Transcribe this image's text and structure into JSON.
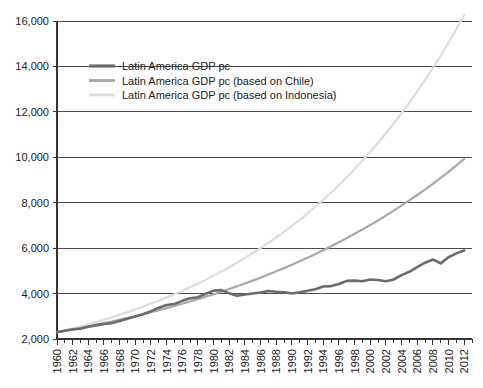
{
  "chart_data": {
    "type": "line",
    "title": "",
    "subtitle": "",
    "xlabel": "",
    "ylabel": "",
    "grid": true,
    "legend_position": "top-left-inside",
    "xlim": [
      1960,
      2013
    ],
    "ylim": [
      2000,
      16000
    ],
    "ytick_labels": [
      "16,000",
      "14,000",
      "12,000",
      "10,000",
      "8,000",
      "6,000",
      "4,000",
      "2,000"
    ],
    "ytick_values": [
      16000,
      14000,
      12000,
      10000,
      8000,
      6000,
      4000,
      2000
    ],
    "xtick_labels": [
      "1960",
      "1962",
      "1964",
      "1966",
      "1968",
      "1970",
      "1972",
      "1974",
      "1976",
      "1978",
      "1980",
      "1982",
      "1984",
      "1986",
      "1988",
      "1990",
      "1992",
      "1994",
      "1996",
      "1998",
      "2000",
      "2002",
      "2004",
      "2006",
      "2008",
      "2010",
      "2012"
    ],
    "xtick_values": [
      1960,
      1962,
      1964,
      1966,
      1968,
      1970,
      1972,
      1974,
      1976,
      1978,
      1980,
      1982,
      1984,
      1986,
      1988,
      1990,
      1992,
      1994,
      1996,
      1998,
      2000,
      2002,
      2004,
      2006,
      2008,
      2010,
      2012
    ],
    "x": [
      1960,
      1961,
      1962,
      1963,
      1964,
      1965,
      1966,
      1967,
      1968,
      1969,
      1970,
      1971,
      1972,
      1973,
      1974,
      1975,
      1976,
      1977,
      1978,
      1979,
      1980,
      1981,
      1982,
      1983,
      1984,
      1985,
      1986,
      1987,
      1988,
      1989,
      1990,
      1991,
      1992,
      1993,
      1994,
      1995,
      1996,
      1997,
      1998,
      1999,
      2000,
      2001,
      2002,
      2003,
      2004,
      2005,
      2006,
      2007,
      2008,
      2009,
      2010,
      2011,
      2012
    ],
    "series": [
      {
        "name": "Latin America GDP pc",
        "color": "#6b6b6b",
        "width": 2.6,
        "values": [
          2300,
          2360,
          2420,
          2450,
          2540,
          2600,
          2660,
          2700,
          2790,
          2890,
          2990,
          3090,
          3220,
          3380,
          3500,
          3540,
          3680,
          3790,
          3840,
          3990,
          4130,
          4150,
          4010,
          3900,
          3960,
          4000,
          4050,
          4110,
          4080,
          4060,
          4000,
          4060,
          4120,
          4190,
          4310,
          4330,
          4420,
          4560,
          4570,
          4540,
          4620,
          4600,
          4540,
          4620,
          4810,
          4960,
          5160,
          5360,
          5500,
          5330,
          5600,
          5770,
          5900
        ]
      },
      {
        "name": "Latin America GDP pc (based on Chile)",
        "color": "#a8a8a8",
        "width": 2.2,
        "values": [
          2300,
          2360,
          2430,
          2490,
          2560,
          2630,
          2700,
          2770,
          2850,
          2930,
          3010,
          3090,
          3180,
          3270,
          3360,
          3450,
          3550,
          3650,
          3750,
          3860,
          3970,
          4080,
          4200,
          4320,
          4440,
          4570,
          4700,
          4840,
          4980,
          5120,
          5270,
          5420,
          5580,
          5740,
          5910,
          6080,
          6260,
          6440,
          6630,
          6820,
          7020,
          7220,
          7430,
          7650,
          7870,
          8100,
          8340,
          8580,
          8830,
          9090,
          9360,
          9640,
          9930
        ]
      },
      {
        "name": "Latin America GDP pc (based on Indonesia)",
        "color": "#dcdcdc",
        "width": 2.2,
        "values": [
          2300,
          2380,
          2470,
          2560,
          2650,
          2750,
          2850,
          2960,
          3070,
          3180,
          3300,
          3430,
          3560,
          3690,
          3830,
          3970,
          4120,
          4280,
          4440,
          4610,
          4790,
          4970,
          5160,
          5360,
          5570,
          5780,
          6000,
          6230,
          6470,
          6720,
          6980,
          7250,
          7530,
          7830,
          8130,
          8450,
          8780,
          9120,
          9480,
          9850,
          10240,
          10640,
          11060,
          11490,
          11940,
          12410,
          12900,
          13400,
          13930,
          14480,
          15050,
          15640,
          16250
        ]
      }
    ]
  },
  "legend": {
    "items": [
      {
        "label": "Latin America GDP pc"
      },
      {
        "label": "Latin America GDP pc (based on Chile)"
      },
      {
        "label": "Latin America GDP pc (based on Indonesia)"
      }
    ]
  },
  "colors": {
    "axis": "#333333",
    "grid": "#4d4d4d",
    "text": "#1a1a1a",
    "series_actual": "#6b6b6b",
    "series_chile": "#a8a8a8",
    "series_indonesia": "#dcdcdc"
  }
}
